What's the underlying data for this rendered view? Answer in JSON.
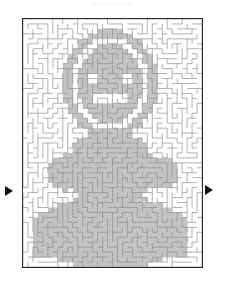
{
  "page": {
    "title": "Maze Puzzle",
    "background_color": "#ffffff"
  },
  "maze": {
    "name": "teddy-bear-maze",
    "border_color": "#2b2b2b",
    "wall_color": "#8f8f8f",
    "shade_color": "#c2c2c2",
    "path_color": "#ffffff",
    "cols": 36,
    "rows": 50,
    "cell_px": 5,
    "frame": {
      "left": 22,
      "top": 18,
      "width": 181,
      "height": 250
    },
    "entrance": {
      "side": "left",
      "label": "entrance-arrow",
      "y": 191
    },
    "exit": {
      "side": "right",
      "label": "exit-arrow",
      "y": 190
    },
    "shape_description": "teddy bear figure",
    "shape_regions": [
      {
        "name": "head-outline",
        "type": "ellipse",
        "cx": 17.5,
        "cy": 13.0,
        "rx": 9.5,
        "ry": 11.0
      },
      {
        "name": "head-inner",
        "type": "ellipse",
        "cx": 17.5,
        "cy": 13.0,
        "rx": 6.5,
        "ry": 8.0
      },
      {
        "name": "eye-left",
        "type": "rect",
        "x": 13.0,
        "y": 11.0,
        "w": 2.0,
        "h": 2.0
      },
      {
        "name": "eye-right",
        "type": "rect",
        "x": 20.0,
        "y": 11.0,
        "w": 2.0,
        "h": 2.0
      },
      {
        "name": "mouth",
        "type": "rect",
        "x": 14.0,
        "y": 15.5,
        "w": 7.0,
        "h": 1.5
      },
      {
        "name": "neck",
        "type": "rect",
        "x": 15.5,
        "y": 22.0,
        "w": 4.0,
        "h": 3.0
      },
      {
        "name": "torso",
        "type": "ellipse",
        "cx": 17.5,
        "cy": 30.0,
        "rx": 9.0,
        "ry": 7.5
      },
      {
        "name": "arm-left",
        "type": "ellipse",
        "cx": 8.5,
        "cy": 31.0,
        "rx": 4.0,
        "ry": 3.5
      },
      {
        "name": "arm-right",
        "type": "ellipse",
        "cx": 27.0,
        "cy": 31.0,
        "rx": 4.0,
        "ry": 3.5
      },
      {
        "name": "lower-body",
        "type": "ellipse",
        "cx": 17.5,
        "cy": 43.0,
        "rx": 16.0,
        "ry": 7.5
      },
      {
        "name": "base",
        "type": "rect",
        "x": 2.0,
        "y": 41.0,
        "w": 31.0,
        "h": 7.0
      }
    ]
  },
  "arrows": {
    "entrance_label": "entrance-arrow",
    "exit_label": "exit-arrow",
    "color": "#111111"
  }
}
